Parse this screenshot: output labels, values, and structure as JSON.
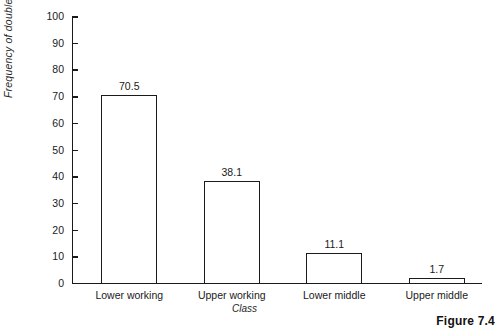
{
  "caption": "Figure 7.4",
  "chart_data": {
    "type": "bar",
    "title": "",
    "xlabel": "Class",
    "ylabel": "Frequency of double negatives",
    "categories": [
      "Lower working",
      "Upper working",
      "Lower middle",
      "Upper middle"
    ],
    "values": [
      70.5,
      38.1,
      11.1,
      1.7
    ],
    "value_labels": [
      "70.5",
      "38.1",
      "11.1",
      "1.7"
    ],
    "ylim": [
      0,
      100
    ],
    "yticks": [
      0,
      10,
      20,
      30,
      40,
      50,
      60,
      70,
      80,
      90,
      100
    ],
    "ytick_labels": [
      "0",
      "10",
      "20",
      "30",
      "40",
      "50",
      "60",
      "70",
      "80",
      "90",
      "100"
    ],
    "grid": false,
    "legend": false,
    "bar_fill": "#ffffff",
    "bar_edge": "#1a1a1a",
    "axis_color": "#1a1a1a"
  }
}
